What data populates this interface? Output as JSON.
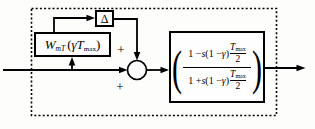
{
  "diagram": {
    "background": "#fdfdfb",
    "line_color": "#000000",
    "wmt_block": {
      "w": "W",
      "w_sub": "mT",
      "open_paren": "(",
      "arg": "γT",
      "arg_sub": "max",
      "close_paren": ")"
    },
    "delta_block": {
      "label": "Δ"
    },
    "sum_junction": {
      "sign_top": "+",
      "sign_bottom": "+"
    },
    "tf_block": {
      "open_paren": "(",
      "close_paren": ")",
      "numerator": {
        "parts": [
          "1 − ",
          "s",
          "(1 − ",
          "γ",
          ")"
        ],
        "frac_num": "T",
        "frac_num_sub": "max",
        "frac_den": "2"
      },
      "denominator": {
        "parts": [
          "1 + ",
          "s",
          "(1 − ",
          "γ",
          ")"
        ],
        "frac_num": "T",
        "frac_num_sub": "max",
        "frac_den": "2"
      }
    }
  }
}
